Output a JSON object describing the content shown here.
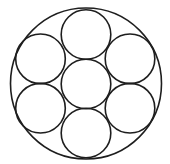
{
  "diagram": {
    "stroke_color": "#1e1e1e",
    "background": "#ffffff",
    "outer_circle": {
      "cx": 86,
      "cy": 83.5,
      "r": 75.5
    },
    "inner_circles": [
      {
        "name": "center",
        "cx": 86,
        "cy": 84,
        "r": 24.8
      },
      {
        "name": "top",
        "cx": 86,
        "cy": 34.5,
        "r": 24.8
      },
      {
        "name": "upper-left",
        "cx": 40.5,
        "cy": 58.8,
        "r": 24.8
      },
      {
        "name": "upper-right",
        "cx": 130,
        "cy": 58.8,
        "r": 24.8
      },
      {
        "name": "lower-left",
        "cx": 40.5,
        "cy": 108.2,
        "r": 24.8
      },
      {
        "name": "lower-right",
        "cx": 130,
        "cy": 108.2,
        "r": 24.8
      },
      {
        "name": "bottom",
        "cx": 86,
        "cy": 133,
        "r": 24.8
      }
    ]
  }
}
